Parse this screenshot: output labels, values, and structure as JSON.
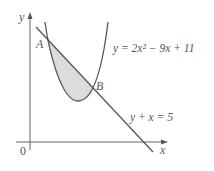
{
  "diagram": {
    "axes": {
      "x_label": "x",
      "y_label": "y",
      "origin_label": "0"
    },
    "points": {
      "A": "A",
      "B": "B"
    },
    "curves": {
      "parabola": {
        "equation": "y = 2x² − 9x + 11"
      },
      "line": {
        "equation": "y + x = 5"
      }
    },
    "shaded_region": "region between line and parabola from A to B",
    "colors": {
      "stroke": "#555555",
      "shade": "#dcdcdc"
    }
  }
}
